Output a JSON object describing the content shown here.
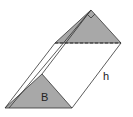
{
  "diagram": {
    "labels": {
      "base": "B",
      "height": "h"
    },
    "colors": {
      "face_fill": "#a8a8a8",
      "stroke": "#333333",
      "background": "#ffffff"
    },
    "shape": "triangular-prism",
    "annotations": [
      "right-angle-marker at top apex",
      "dashed hidden edge on top face"
    ]
  }
}
